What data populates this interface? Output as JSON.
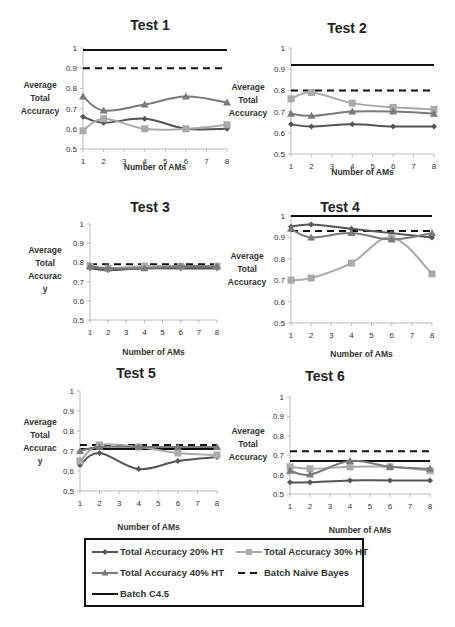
{
  "figure": {
    "legend": {
      "items": [
        {
          "label": "Total Accuracy 20% HT",
          "key": "ht20"
        },
        {
          "label": "Total Accuracy 30% HT",
          "key": "ht30"
        },
        {
          "label": "Total Accuracy 40% HT",
          "key": "ht40"
        },
        {
          "label": "Batch Naive Bayes",
          "key": "nb"
        },
        {
          "label": "Batch C4.5",
          "key": "c45"
        }
      ]
    },
    "colors": {
      "ht20": "#555555",
      "ht30": "#aaaaaa",
      "ht40": "#7a7a7a",
      "nb": "#111111",
      "c45": "#111111"
    }
  },
  "chart_data": [
    {
      "type": "line",
      "title": "Test 1",
      "xlabel": "Number of AMs",
      "ylabel": "Average Total Accuracy",
      "x": [
        1,
        2,
        4,
        6,
        8
      ],
      "xticks": [
        1,
        2,
        3,
        4,
        5,
        6,
        7,
        8
      ],
      "yticks": [
        0.5,
        0.6,
        0.7,
        0.8,
        0.9,
        1
      ],
      "ylim": [
        0.5,
        1
      ],
      "series": [
        {
          "name": "Total Accuracy 20% HT",
          "values": [
            0.66,
            0.63,
            0.65,
            0.6,
            0.6
          ]
        },
        {
          "name": "Total Accuracy 30% HT",
          "values": [
            0.59,
            0.65,
            0.6,
            0.6,
            0.62
          ]
        },
        {
          "name": "Total Accuracy 40% HT",
          "values": [
            0.76,
            0.69,
            0.72,
            0.76,
            0.73
          ]
        },
        {
          "name": "Batch Naive Bayes",
          "values": [
            0.9,
            0.9,
            0.9,
            0.9,
            0.9
          ]
        },
        {
          "name": "Batch C4.5",
          "values": [
            0.99,
            0.99,
            0.99,
            0.99,
            0.99
          ]
        }
      ]
    },
    {
      "type": "line",
      "title": "Test 2",
      "xlabel": "Number of AMs",
      "ylabel": "Average Total Accuracy",
      "x": [
        1,
        2,
        4,
        6,
        8
      ],
      "xticks": [
        1,
        2,
        3,
        4,
        5,
        6,
        7,
        8
      ],
      "yticks": [
        0.5,
        0.6,
        0.7,
        0.8,
        0.9,
        1
      ],
      "ylim": [
        0.5,
        1
      ],
      "series": [
        {
          "name": "Total Accuracy 20% HT",
          "values": [
            0.64,
            0.63,
            0.64,
            0.63,
            0.63
          ]
        },
        {
          "name": "Total Accuracy 30% HT",
          "values": [
            0.76,
            0.79,
            0.74,
            0.72,
            0.71
          ]
        },
        {
          "name": "Total Accuracy 40% HT",
          "values": [
            0.69,
            0.68,
            0.7,
            0.7,
            0.69
          ]
        },
        {
          "name": "Batch Naive Bayes",
          "values": [
            0.8,
            0.8,
            0.8,
            0.8,
            0.8
          ]
        },
        {
          "name": "Batch C4.5",
          "values": [
            0.92,
            0.92,
            0.92,
            0.92,
            0.92
          ]
        }
      ]
    },
    {
      "type": "line",
      "title": "Test 3",
      "xlabel": "Number of AMs",
      "ylabel": "Average Total Accurac y",
      "x": [
        1,
        2,
        4,
        6,
        8
      ],
      "xticks": [
        1,
        2,
        3,
        4,
        5,
        6,
        7,
        8
      ],
      "yticks": [
        0.5,
        0.6,
        0.7,
        0.8,
        0.9,
        1
      ],
      "ylim": [
        0.5,
        1
      ],
      "series": [
        {
          "name": "Total Accuracy 20% HT",
          "values": [
            0.77,
            0.76,
            0.77,
            0.77,
            0.77
          ]
        },
        {
          "name": "Total Accuracy 30% HT",
          "values": [
            0.78,
            0.77,
            0.78,
            0.78,
            0.78
          ]
        },
        {
          "name": "Total Accuracy 40% HT",
          "values": [
            0.78,
            0.77,
            0.77,
            0.78,
            0.78
          ]
        },
        {
          "name": "Batch Naive Bayes",
          "values": [
            0.79,
            0.79,
            0.79,
            0.79,
            0.79
          ]
        },
        {
          "name": "Batch C4.5",
          "values": [
            0.77,
            0.77,
            0.77,
            0.77,
            0.77
          ]
        }
      ]
    },
    {
      "type": "line",
      "title": "Test 4",
      "xlabel": "Number of AMs",
      "ylabel": "Average Total Accuracy",
      "x": [
        1,
        2,
        4,
        6,
        8
      ],
      "xticks": [
        1,
        2,
        3,
        4,
        5,
        6,
        7,
        8
      ],
      "yticks": [
        0.5,
        0.6,
        0.7,
        0.8,
        0.9,
        1
      ],
      "ylim": [
        0.5,
        1
      ],
      "series": [
        {
          "name": "Total Accuracy 20% HT",
          "values": [
            0.95,
            0.96,
            0.94,
            0.92,
            0.9
          ]
        },
        {
          "name": "Total Accuracy 30% HT",
          "values": [
            0.7,
            0.71,
            0.78,
            0.9,
            0.73
          ]
        },
        {
          "name": "Total Accuracy 40% HT",
          "values": [
            0.94,
            0.9,
            0.92,
            0.89,
            0.92
          ]
        },
        {
          "name": "Batch Naive Bayes",
          "values": [
            0.93,
            0.93,
            0.93,
            0.93,
            0.93
          ]
        },
        {
          "name": "Batch C4.5",
          "values": [
            1.0,
            1.0,
            1.0,
            1.0,
            1.0
          ]
        }
      ]
    },
    {
      "type": "line",
      "title": "Test 5",
      "xlabel": "Number of AMs",
      "ylabel": "Average Total Accurac y",
      "x": [
        1,
        2,
        4,
        6,
        8
      ],
      "xticks": [
        1,
        2,
        3,
        4,
        5,
        6,
        7,
        8
      ],
      "yticks": [
        0.5,
        0.6,
        0.7,
        0.8,
        0.9,
        1
      ],
      "ylim": [
        0.5,
        1
      ],
      "series": [
        {
          "name": "Total Accuracy 20% HT",
          "values": [
            0.63,
            0.69,
            0.61,
            0.65,
            0.67
          ]
        },
        {
          "name": "Total Accuracy 30% HT",
          "values": [
            0.65,
            0.73,
            0.72,
            0.69,
            0.68
          ]
        },
        {
          "name": "Total Accuracy 40% HT",
          "values": [
            0.7,
            0.72,
            0.72,
            0.72,
            0.72
          ]
        },
        {
          "name": "Batch Naive Bayes",
          "values": [
            0.73,
            0.73,
            0.73,
            0.73,
            0.73
          ]
        },
        {
          "name": "Batch C4.5",
          "values": [
            0.71,
            0.71,
            0.71,
            0.71,
            0.71
          ]
        }
      ]
    },
    {
      "type": "line",
      "title": "Test 6",
      "xlabel": "Number of AMs",
      "ylabel": "Average Total Accuracy",
      "x": [
        1,
        2,
        4,
        6,
        8
      ],
      "xticks": [
        1,
        2,
        3,
        4,
        5,
        6,
        7,
        8
      ],
      "yticks": [
        0.5,
        0.6,
        0.7,
        0.8,
        0.9,
        1
      ],
      "ylim": [
        0.5,
        1
      ],
      "series": [
        {
          "name": "Total Accuracy 20% HT",
          "values": [
            0.56,
            0.56,
            0.57,
            0.57,
            0.57
          ]
        },
        {
          "name": "Total Accuracy 30% HT",
          "values": [
            0.64,
            0.63,
            0.64,
            0.64,
            0.62
          ]
        },
        {
          "name": "Total Accuracy 40% HT",
          "values": [
            0.62,
            0.6,
            0.67,
            0.64,
            0.63
          ]
        },
        {
          "name": "Batch Naive Bayes",
          "values": [
            0.72,
            0.72,
            0.72,
            0.72,
            0.72
          ]
        },
        {
          "name": "Batch C4.5",
          "values": [
            0.67,
            0.67,
            0.67,
            0.67,
            0.67
          ]
        }
      ]
    }
  ]
}
